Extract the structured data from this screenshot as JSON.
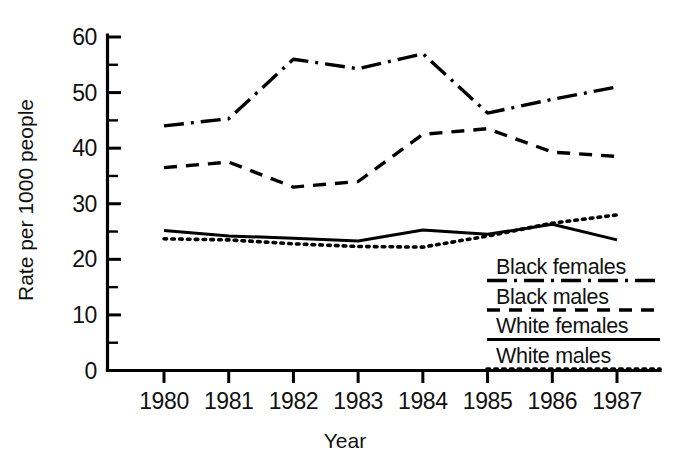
{
  "chart_data": {
    "type": "line",
    "title": "",
    "xlabel": "Year",
    "ylabel": "Rate per 1000 people",
    "x": [
      1980,
      1981,
      1982,
      1983,
      1984,
      1985,
      1986,
      1987
    ],
    "categories": [
      "1980",
      "1981",
      "1982",
      "1983",
      "1984",
      "1985",
      "1986",
      "1987"
    ],
    "xlim": [
      1980,
      1987
    ],
    "ylim": [
      0,
      60
    ],
    "y_ticks": [
      0,
      10,
      20,
      30,
      40,
      50,
      60
    ],
    "y_tick_labels": [
      "0",
      "10",
      "20",
      "30",
      "40",
      "50",
      "60"
    ],
    "y_minor_ticks": [
      5,
      15,
      25,
      35,
      45,
      55
    ],
    "grid": false,
    "legend_position": "inside-bottom-right",
    "series": [
      {
        "name": "Black females",
        "style": "dash-dot",
        "values": [
          44.0,
          45.3,
          56.0,
          54.3,
          57.0,
          46.3,
          48.8,
          51.0
        ]
      },
      {
        "name": "Black males",
        "style": "dashed",
        "values": [
          36.5,
          37.5,
          33.0,
          34.0,
          42.5,
          43.5,
          39.3,
          38.5
        ]
      },
      {
        "name": "White females",
        "style": "solid",
        "values": [
          25.2,
          24.2,
          23.8,
          23.3,
          25.3,
          24.5,
          26.3,
          23.5
        ]
      },
      {
        "name": "White males",
        "style": "dotted",
        "values": [
          23.7,
          23.5,
          22.8,
          22.3,
          22.2,
          24.2,
          26.5,
          28.0
        ]
      }
    ]
  },
  "axes": {
    "y_title": "Rate per 1000 people",
    "x_title": "Year",
    "y_labels": [
      "60",
      "50",
      "40",
      "30",
      "20",
      "10",
      "0"
    ],
    "x_labels": [
      "1980",
      "1981",
      "1982",
      "1983",
      "1984",
      "1985",
      "1986",
      "1987"
    ]
  },
  "legend": {
    "entries": [
      {
        "label": "Black females",
        "style": "dash-dot"
      },
      {
        "label": "Black males",
        "style": "dashed"
      },
      {
        "label": "White females",
        "style": "solid"
      },
      {
        "label": "White males",
        "style": "dotted"
      }
    ]
  },
  "colors": {
    "ink": "#000000",
    "background": "#ffffff"
  }
}
